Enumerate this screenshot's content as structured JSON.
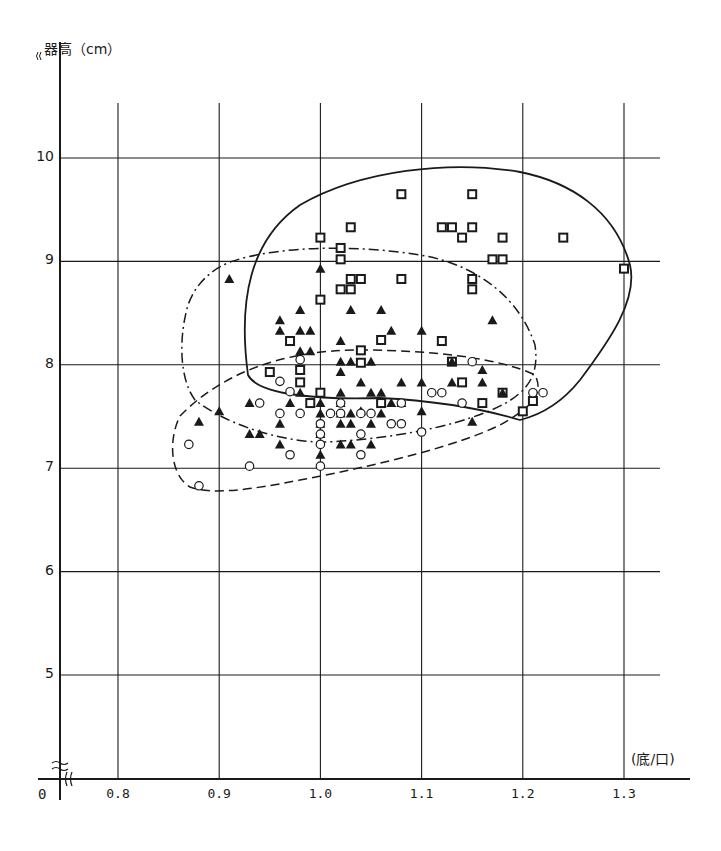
{
  "chart_data": {
    "type": "scatter",
    "title": "",
    "xlabel": "(底/口)",
    "ylabel": "器高（cm）",
    "origin_label": "0",
    "x_ticks": [
      "0.8",
      "0.9",
      "1.0",
      "1.1",
      "1.2",
      "1.3"
    ],
    "y_ticks": [
      "5",
      "6",
      "7",
      "8",
      "9",
      "10"
    ],
    "xlim": [
      0.8,
      1.34
    ],
    "ylim": [
      4.0,
      11.2
    ],
    "grid": true,
    "axis_breaks": {
      "x": true,
      "y": true
    },
    "legend": "none",
    "series": [
      {
        "name": "square-markers",
        "marker": "open-square",
        "enclosure": "solid",
        "points": [
          [
            1.0,
            9.23
          ],
          [
            1.0,
            8.63
          ],
          [
            1.02,
            9.13
          ],
          [
            1.02,
            9.02
          ],
          [
            1.03,
            9.33
          ],
          [
            1.02,
            8.73
          ],
          [
            1.03,
            8.73
          ],
          [
            1.03,
            8.83
          ],
          [
            1.04,
            8.83
          ],
          [
            1.08,
            9.65
          ],
          [
            1.08,
            8.83
          ],
          [
            1.12,
            9.33
          ],
          [
            1.13,
            9.33
          ],
          [
            1.14,
            9.23
          ],
          [
            1.15,
            9.33
          ],
          [
            1.15,
            9.65
          ],
          [
            1.15,
            8.83
          ],
          [
            1.15,
            8.73
          ],
          [
            1.17,
            9.02
          ],
          [
            1.18,
            9.02
          ],
          [
            1.18,
            9.23
          ],
          [
            1.24,
            9.23
          ],
          [
            1.3,
            8.93
          ],
          [
            0.97,
            8.23
          ],
          [
            0.98,
            7.95
          ],
          [
            0.98,
            7.83
          ],
          [
            0.95,
            7.93
          ],
          [
            1.0,
            7.73
          ],
          [
            1.04,
            8.14
          ],
          [
            1.06,
            8.24
          ],
          [
            1.04,
            8.02
          ],
          [
            1.12,
            8.23
          ],
          [
            1.14,
            7.83
          ],
          [
            1.06,
            7.63
          ],
          [
            1.16,
            7.63
          ],
          [
            1.2,
            7.55
          ],
          [
            1.21,
            7.65
          ],
          [
            0.99,
            7.63
          ],
          [
            1.13,
            8.03
          ],
          [
            1.18,
            7.73
          ]
        ]
      },
      {
        "name": "triangle-markers",
        "marker": "filled-triangle",
        "enclosure": "dash-dot",
        "points": [
          [
            0.91,
            8.83
          ],
          [
            1.0,
            8.93
          ],
          [
            0.96,
            8.43
          ],
          [
            0.96,
            8.33
          ],
          [
            0.98,
            8.53
          ],
          [
            0.98,
            8.33
          ],
          [
            0.99,
            8.33
          ],
          [
            0.98,
            8.13
          ],
          [
            0.99,
            8.13
          ],
          [
            1.02,
            8.23
          ],
          [
            1.03,
            8.53
          ],
          [
            1.02,
            8.03
          ],
          [
            1.02,
            7.93
          ],
          [
            1.02,
            7.73
          ],
          [
            1.03,
            8.03
          ],
          [
            1.05,
            8.03
          ],
          [
            1.05,
            7.73
          ],
          [
            1.07,
            8.33
          ],
          [
            1.06,
            8.53
          ],
          [
            1.1,
            8.33
          ],
          [
            1.04,
            7.83
          ],
          [
            1.06,
            7.73
          ],
          [
            1.08,
            7.83
          ],
          [
            1.1,
            7.83
          ],
          [
            1.13,
            7.83
          ],
          [
            1.13,
            8.03
          ],
          [
            1.16,
            7.95
          ],
          [
            1.16,
            7.83
          ],
          [
            1.17,
            8.43
          ],
          [
            1.18,
            7.73
          ],
          [
            1.0,
            7.63
          ],
          [
            1.0,
            7.53
          ],
          [
            1.0,
            7.43
          ],
          [
            1.0,
            7.33
          ],
          [
            1.02,
            7.63
          ],
          [
            1.02,
            7.53
          ],
          [
            1.03,
            7.53
          ],
          [
            1.04,
            7.55
          ],
          [
            1.02,
            7.43
          ],
          [
            1.03,
            7.43
          ],
          [
            1.02,
            7.23
          ],
          [
            1.03,
            7.23
          ],
          [
            1.05,
            7.43
          ],
          [
            1.05,
            7.23
          ],
          [
            1.06,
            7.53
          ],
          [
            1.07,
            7.63
          ],
          [
            1.08,
            7.63
          ],
          [
            1.1,
            7.55
          ],
          [
            1.15,
            7.45
          ],
          [
            0.97,
            7.63
          ],
          [
            0.96,
            7.43
          ],
          [
            0.96,
            7.23
          ],
          [
            0.93,
            7.33
          ],
          [
            0.94,
            7.33
          ],
          [
            0.93,
            7.63
          ],
          [
            0.9,
            7.55
          ],
          [
            0.88,
            7.45
          ],
          [
            0.98,
            7.73
          ],
          [
            1.0,
            7.13
          ]
        ]
      },
      {
        "name": "circle-markers",
        "marker": "open-circle",
        "enclosure": "dashed",
        "points": [
          [
            0.96,
            7.84
          ],
          [
            0.98,
            8.05
          ],
          [
            0.97,
            7.74
          ],
          [
            0.94,
            7.63
          ],
          [
            0.96,
            7.53
          ],
          [
            0.98,
            7.53
          ],
          [
            0.97,
            7.13
          ],
          [
            0.93,
            7.02
          ],
          [
            0.87,
            7.23
          ],
          [
            0.88,
            6.83
          ],
          [
            1.0,
            7.43
          ],
          [
            1.0,
            7.33
          ],
          [
            1.0,
            7.23
          ],
          [
            1.01,
            7.53
          ],
          [
            1.02,
            7.63
          ],
          [
            1.02,
            7.53
          ],
          [
            1.04,
            7.53
          ],
          [
            1.05,
            7.53
          ],
          [
            1.04,
            7.33
          ],
          [
            1.04,
            7.13
          ],
          [
            1.07,
            7.43
          ],
          [
            1.08,
            7.43
          ],
          [
            1.08,
            7.63
          ],
          [
            1.1,
            7.35
          ],
          [
            1.11,
            7.73
          ],
          [
            1.12,
            7.73
          ],
          [
            1.14,
            7.63
          ],
          [
            1.15,
            8.03
          ],
          [
            1.21,
            7.73
          ],
          [
            1.22,
            7.73
          ],
          [
            1.0,
            7.02
          ]
        ]
      }
    ],
    "enclosures": [
      {
        "style": "solid",
        "encloses": "square-markers",
        "approx_x_range": [
          0.94,
          1.31
        ],
        "approx_y_range": [
          7.45,
          9.9
        ]
      },
      {
        "style": "dash-dot",
        "encloses": "triangle-markers",
        "approx_x_range": [
          0.86,
          1.22
        ],
        "approx_y_range": [
          7.1,
          9.05
        ]
      },
      {
        "style": "dashed",
        "encloses": "circle-markers",
        "approx_x_range": [
          0.86,
          1.22
        ],
        "approx_y_range": [
          6.75,
          8.15
        ]
      }
    ]
  }
}
